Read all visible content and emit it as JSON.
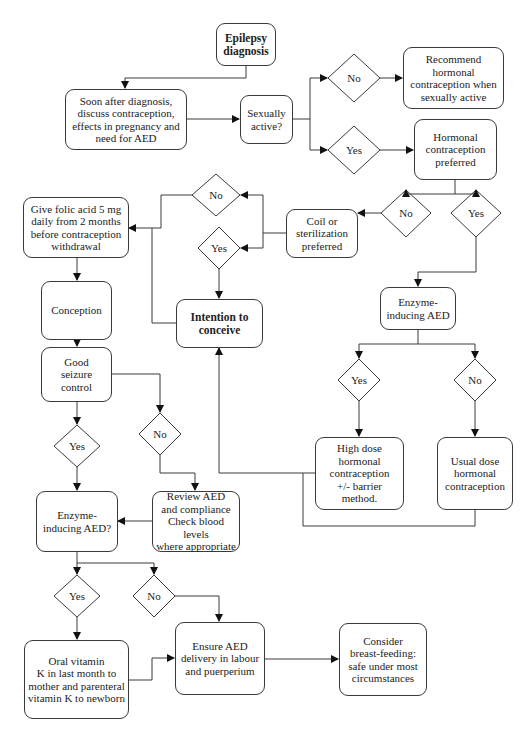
{
  "diagram": {
    "nodes": {
      "epilepsy_diagnosis": "Epilepsy\ndiagnosis",
      "discuss_contraception": "Soon after diagnosis,\ndiscuss contraception,\neffects  in pregnancy and\nneed for AED",
      "sexually_active": "Sexually\nactive?",
      "recommend_hormonal": "Recommend\nhormonal\ncontraception when\nsexually active",
      "hormonal_preferred": "Hormonal\ncontraception\npreferred",
      "coil_sterilization": "Coil or\nsterilization\npreferred",
      "folic_acid": "Give folic acid 5 mg\ndaily from 2 months\nbefore contraception\nwithdrawal",
      "intention_to_conceive": "Intention to\nconceive",
      "conception": "Conception",
      "enzyme_inducing_right": "Enzyme-\ninducing AED",
      "high_dose": "High dose\nhormonal\ncontraception\n+/- barrier\nmethod.",
      "usual_dose": "Usual dose\nhormonal\ncontraception",
      "good_seizure_control": "Good\nseizure\ncontrol",
      "enzyme_inducing_left": "Enzyme-\ninducing AED?",
      "review_aed": "Review AED\nand compliance\nCheck blood levels\nwhere appropriate",
      "vitamin_k": "Oral vitamin\nK in last month to\nmother and parenteral\nvitamin K to newborn",
      "ensure_aed_delivery": "Ensure AED\ndelivery in labour\nand puerperium",
      "breast_feeding": "Consider\nbreast-feeding:\nsafe under most\ncircumstances"
    },
    "decisions": {
      "sexually_active_no": "No",
      "sexually_active_yes": "Yes",
      "hormonal_no": "No",
      "hormonal_yes": "Yes",
      "coil_no": "No",
      "coil_yes": "Yes",
      "enzyme_right_yes": "Yes",
      "enzyme_right_no": "No",
      "seizure_yes": "Yes",
      "seizure_no": "No",
      "enzyme_left_yes": "Yes",
      "enzyme_left_no": "No"
    },
    "colors": {
      "line": "#3a3a3a",
      "text": "#222222",
      "background": "#ffffff"
    }
  }
}
